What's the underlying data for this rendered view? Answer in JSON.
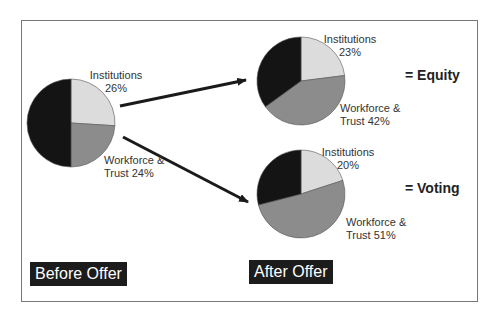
{
  "chart_data": [
    {
      "type": "pie",
      "title": "Before Offer",
      "categories": [
        "Institutions",
        "Workforce & Trust",
        "Other"
      ],
      "values": [
        26,
        24,
        50
      ],
      "labels": [
        "Institutions 26%",
        "Workforce & Trust 24%"
      ],
      "colors": [
        "#dcdcdc",
        "#8c8c8c",
        "#141414"
      ]
    },
    {
      "type": "pie",
      "title": "After Offer = Equity",
      "categories": [
        "Institutions",
        "Workforce & Trust",
        "Other"
      ],
      "values": [
        23,
        42,
        35
      ],
      "labels": [
        "Institutions 23%",
        "Workforce & Trust 42%"
      ],
      "colors": [
        "#dcdcdc",
        "#8c8c8c",
        "#141414"
      ]
    },
    {
      "type": "pie",
      "title": "After Offer = Voting",
      "categories": [
        "Institutions",
        "Workforce & Trust",
        "Other"
      ],
      "values": [
        20,
        51,
        29
      ],
      "labels": [
        "Institutions 20%",
        "Workforce & Trust 51%"
      ],
      "colors": [
        "#dcdcdc",
        "#8c8c8c",
        "#141414"
      ]
    }
  ],
  "labels": {
    "before_inst_name": "Institutions",
    "before_inst_pct": "26%",
    "before_wf_line1": "Workforce &",
    "before_wf_line2": "Trust 24%",
    "equity_inst_name": "Institutions",
    "equity_inst_pct": "23%",
    "equity_wf_line1": "Workforce &",
    "equity_wf_line2": "Trust 42%",
    "voting_inst_name": "Institutions",
    "voting_inst_pct": "20%",
    "voting_wf_line1": "Workforce &",
    "voting_wf_line2": "Trust 51%",
    "equity_tag": "= Equity",
    "voting_tag": "= Voting",
    "before_offer": "Before Offer",
    "after_offer": "After Offer"
  }
}
